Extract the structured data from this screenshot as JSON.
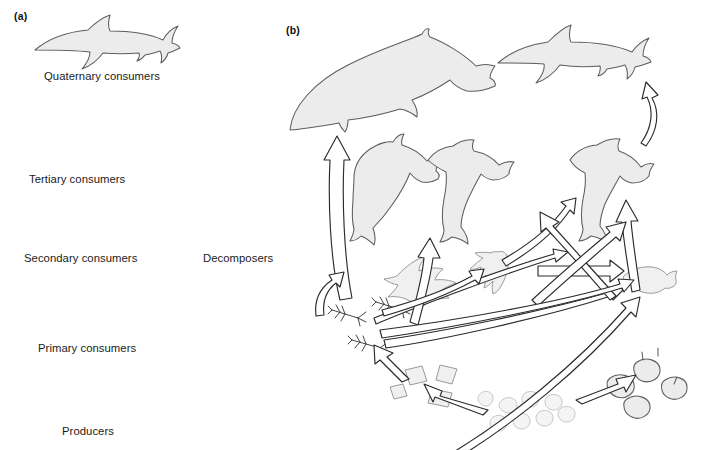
{
  "figure": {
    "panels": [
      {
        "id": "a",
        "label": "(a)",
        "type": "food-chain",
        "levels": [
          {
            "name": "quaternary-consumers",
            "label": "Quaternary consumers",
            "organism": "shark"
          },
          {
            "name": "tertiary-consumers",
            "label": "Tertiary consumers",
            "organism": "large-fish"
          },
          {
            "name": "secondary-consumers",
            "label": "Secondary consumers",
            "organism": "small-fish"
          },
          {
            "name": "primary-consumers",
            "label": "Primary consumers",
            "organism": "zooplankton"
          },
          {
            "name": "producers",
            "label": "Producers",
            "organism": "phytoplankton"
          }
        ],
        "sink": {
          "name": "decomposers",
          "label": "Decomposers",
          "organism": "bacteria"
        }
      },
      {
        "id": "b",
        "label": "(b)",
        "type": "food-web",
        "organisms": [
          {
            "name": "baleen-whale"
          },
          {
            "name": "shark"
          },
          {
            "name": "dolphin"
          },
          {
            "name": "hammerhead-shark"
          },
          {
            "name": "predatory-fish"
          },
          {
            "name": "seabird"
          },
          {
            "name": "squid"
          },
          {
            "name": "small-fish"
          },
          {
            "name": "krill"
          },
          {
            "name": "diatoms"
          },
          {
            "name": "shellfish"
          },
          {
            "name": "phytoplankton"
          }
        ]
      }
    ]
  },
  "colors": {
    "organism_fill": "#ececec",
    "organism_stroke": "#5d5d5d",
    "arrow_fill": "#ffffff",
    "arrow_stroke": "#2b2b2b",
    "background": "#ffffff",
    "text": "#1b1b1b"
  }
}
